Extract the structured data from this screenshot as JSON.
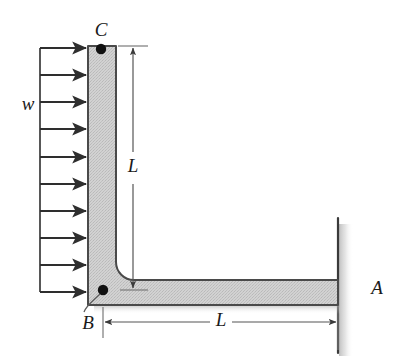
{
  "figure": {
    "type": "engineering-free-body-diagram",
    "width": 407,
    "height": 364,
    "background_color": "#ffffff"
  },
  "labels": {
    "load": "w",
    "point_c": "C",
    "point_b": "B",
    "point_a": "A",
    "dim_vertical": "L",
    "dim_horizontal": "L"
  },
  "colors": {
    "member_fill": "#cdcdcd",
    "member_stroke": "#4a4a4a",
    "line": "#3a3a3a",
    "dimension_line": "#555555",
    "text": "#1a1a1a",
    "wall_shadow": "#d8d8d8",
    "node_dot": "#111111"
  },
  "geometry": {
    "vertical_member": {
      "left_x": 88,
      "right_x": 116,
      "top_y": 46,
      "bottom_y": 305,
      "thickness": 28
    },
    "horizontal_member": {
      "left_x": 88,
      "right_x": 338,
      "top_y": 280,
      "bottom_y": 305,
      "thickness": 25
    },
    "fillet_radius": 18,
    "wall": {
      "x": 338,
      "top_y": 218,
      "bottom_y": 353,
      "shadow_width": 12
    },
    "node_c": {
      "x": 101,
      "y": 49,
      "radius": 5
    },
    "node_b": {
      "x": 103,
      "y": 290,
      "radius": 5
    },
    "dimension_vertical": {
      "x": 133,
      "top_y": 48,
      "bottom_y": 288
    },
    "dimension_horizontal": {
      "y": 322,
      "left_x": 103,
      "right_x": 337
    }
  },
  "load": {
    "symbol": "w",
    "description": "uniformly distributed load applied to vertical member, pointing right",
    "arrow_count": 10,
    "arrow_tail_x": 40,
    "arrow_tip_x": 88,
    "arrow_start_y": 48,
    "arrow_spacing": 27.1,
    "load_boundary_line_x": 40
  }
}
